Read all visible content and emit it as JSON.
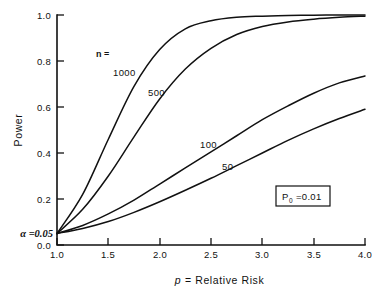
{
  "chart_data": {
    "type": "line",
    "title": "",
    "xlabel": "p = Relative Risk",
    "xlabel_symbol": "p",
    "xlabel_rest": "= Relative  Risk",
    "ylabel": "Power",
    "xlim": [
      1.0,
      4.0
    ],
    "ylim": [
      0.0,
      1.0
    ],
    "grid": false,
    "legend_position": "inline-curve-labels",
    "x_ticks": [
      "1.0",
      "1.5",
      "2.0",
      "2.5",
      "3.0",
      "3.5",
      "4.0"
    ],
    "x_tick_values": [
      1.0,
      1.5,
      2.0,
      2.5,
      3.0,
      3.5,
      4.0
    ],
    "y_ticks": [
      "0.0",
      "0.2",
      "0.4",
      "0.6",
      "0.8",
      "1.0"
    ],
    "y_tick_values": [
      0.0,
      0.2,
      0.4,
      0.6,
      0.8,
      1.0
    ],
    "series_group_label": "n =",
    "x": [
      1.0,
      1.25,
      1.5,
      1.75,
      2.0,
      2.25,
      2.5,
      2.75,
      3.0,
      3.25,
      3.5,
      3.75,
      4.0
    ],
    "series": [
      {
        "name": "1000",
        "label": "1000",
        "values": [
          0.05,
          0.22,
          0.46,
          0.69,
          0.85,
          0.94,
          0.975,
          0.99,
          0.995,
          0.998,
          0.999,
          1.0,
          1.0
        ]
      },
      {
        "name": "500",
        "label": "500",
        "values": [
          0.05,
          0.155,
          0.3,
          0.47,
          0.635,
          0.765,
          0.855,
          0.915,
          0.95,
          0.97,
          0.982,
          0.99,
          0.995
        ]
      },
      {
        "name": "100",
        "label": "100",
        "values": [
          0.05,
          0.085,
          0.135,
          0.195,
          0.265,
          0.335,
          0.405,
          0.475,
          0.545,
          0.605,
          0.66,
          0.705,
          0.735
        ]
      },
      {
        "name": "50",
        "label": "50",
        "values": [
          0.05,
          0.072,
          0.102,
          0.142,
          0.188,
          0.238,
          0.29,
          0.345,
          0.4,
          0.455,
          0.505,
          0.55,
          0.59
        ]
      }
    ],
    "annotations": [
      {
        "id": "alpha",
        "text": "α =0.05",
        "x": 1.0,
        "y": 0.05
      },
      {
        "id": "p0-box",
        "text": "P",
        "subscript": "0",
        "value": "=0.01",
        "x": 3.25,
        "y": 0.22
      }
    ]
  }
}
